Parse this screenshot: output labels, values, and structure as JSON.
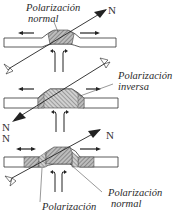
{
  "diagram": {
    "panels": [
      {
        "id": "top",
        "label_line1": "Polarización",
        "label_line2": "normal",
        "north": "N"
      },
      {
        "id": "middle",
        "label_line1": "Polarización",
        "label_line2": "inversa",
        "north": "N"
      },
      {
        "id": "bottom",
        "north_left": "N",
        "north_right": "N",
        "label_right_line1": "Polarización",
        "label_right_line2": "normal",
        "label_bottom": "Polarización"
      }
    ],
    "colors": {
      "ink": "#2a2a2a",
      "hatch": "#8a8a8a",
      "band_fill": "#ffffff"
    }
  }
}
